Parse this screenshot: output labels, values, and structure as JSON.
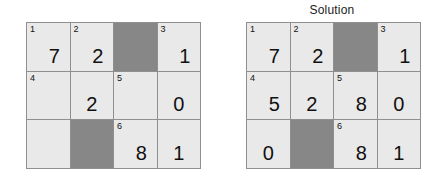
{
  "panels": [
    {
      "name": "puzzle",
      "title": "",
      "title_visible": false,
      "grid": {
        "rows": 3,
        "cols": 4,
        "cells": [
          [
            {
              "clue": "1",
              "value": "7",
              "blocked": false
            },
            {
              "clue": "2",
              "value": "2",
              "blocked": false
            },
            {
              "clue": "",
              "value": "",
              "blocked": true
            },
            {
              "clue": "3",
              "value": "1",
              "blocked": false
            }
          ],
          [
            {
              "clue": "4",
              "value": "",
              "blocked": false
            },
            {
              "clue": "",
              "value": "2",
              "blocked": false
            },
            {
              "clue": "5",
              "value": "",
              "blocked": false
            },
            {
              "clue": "",
              "value": "0",
              "blocked": false
            }
          ],
          [
            {
              "clue": "",
              "value": "",
              "blocked": false
            },
            {
              "clue": "",
              "value": "",
              "blocked": true
            },
            {
              "clue": "6",
              "value": "8",
              "blocked": false
            },
            {
              "clue": "",
              "value": "1",
              "blocked": false
            }
          ]
        ]
      }
    },
    {
      "name": "solution",
      "title": "Solution",
      "title_visible": true,
      "grid": {
        "rows": 3,
        "cols": 4,
        "cells": [
          [
            {
              "clue": "1",
              "value": "7",
              "blocked": false
            },
            {
              "clue": "2",
              "value": "2",
              "blocked": false
            },
            {
              "clue": "",
              "value": "",
              "blocked": true
            },
            {
              "clue": "3",
              "value": "1",
              "blocked": false
            }
          ],
          [
            {
              "clue": "4",
              "value": "5",
              "blocked": false
            },
            {
              "clue": "",
              "value": "2",
              "blocked": false
            },
            {
              "clue": "5",
              "value": "8",
              "blocked": false
            },
            {
              "clue": "",
              "value": "0",
              "blocked": false
            }
          ],
          [
            {
              "clue": "",
              "value": "0",
              "blocked": false
            },
            {
              "clue": "",
              "value": "",
              "blocked": true
            },
            {
              "clue": "6",
              "value": "8",
              "blocked": false
            },
            {
              "clue": "",
              "value": "1",
              "blocked": false
            }
          ]
        ]
      }
    }
  ],
  "colors": {
    "cell_open": "#e9e9e9",
    "cell_blocked": "#878787",
    "grid_line": "#8f8f8f",
    "text": "#101010",
    "background": "#ffffff"
  }
}
